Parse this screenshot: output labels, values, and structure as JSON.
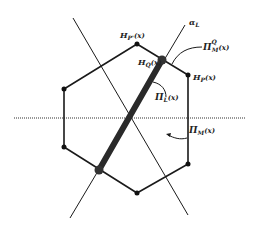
{
  "diagram": {
    "type": "geometric-construction",
    "colors": {
      "ink": "#1a1a1a",
      "thick_segment": "#2a2a2a",
      "background": "#ffffff"
    },
    "labels": {
      "h_p_prime": {
        "main": "H",
        "sub": "P'",
        "arg": "(x)"
      },
      "h_q": {
        "main": "H",
        "sub": "Q",
        "arg": "(x)"
      },
      "h_p": {
        "main": "H",
        "sub": "P",
        "arg": "(x)"
      },
      "alpha_l": {
        "main": "α",
        "sub": "L"
      },
      "pi_m_q": {
        "main": "Π",
        "sub": "M",
        "sup": "Q",
        "arg": "(x)"
      },
      "pi_l": {
        "main": "Π",
        "sub": "L",
        "arg": "(x)"
      },
      "pi_m": {
        "main": "Π",
        "sub": "M",
        "arg": "(x)"
      }
    },
    "hexagon_vertices": [
      {
        "name": "top",
        "x": 137,
        "y": 44
      },
      {
        "name": "upper-right",
        "x": 188,
        "y": 75
      },
      {
        "name": "lower-right",
        "x": 188,
        "y": 164
      },
      {
        "name": "bottom",
        "x": 137,
        "y": 193
      },
      {
        "name": "lower-left",
        "x": 64,
        "y": 147
      },
      {
        "name": "upper-left",
        "x": 64,
        "y": 89
      }
    ],
    "horizontal_axis": {
      "y": 118,
      "x1": 14,
      "x2": 246,
      "style": "dotted"
    },
    "line_alpha_l": {
      "x1": 70,
      "y1": 218,
      "x2": 185,
      "y2": 25
    },
    "line_diagonal": {
      "x1": 73,
      "y1": 18,
      "x2": 188,
      "y2": 215
    },
    "thick_segment": {
      "x1": 99,
      "y1": 170,
      "x2": 162,
      "y2": 60
    }
  }
}
